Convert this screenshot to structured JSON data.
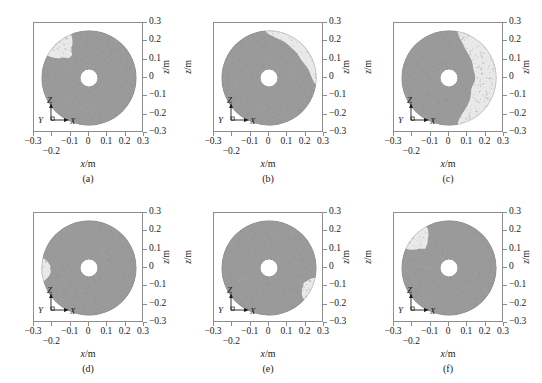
{
  "figure": {
    "axis_titles": {
      "x": "x",
      "x_unit": "/m",
      "z": "z",
      "z_unit": "/m"
    },
    "triad": {
      "z": "Z",
      "x": "X",
      "y": "Y"
    },
    "colors": {
      "particle_dark": "#9a9a9a",
      "particle_light": "#e9e9e9",
      "frame": "#8e8e8e",
      "background": "#ffffff",
      "text": "#1a1a1a"
    },
    "xticks": [
      "-0.3",
      "-0.2",
      "-0.1",
      "0",
      "0.1",
      "0.2",
      "0.3"
    ],
    "yticks": [
      "0.3",
      "0.2",
      "0.1",
      "0",
      "-0.1",
      "-0.2",
      "-0.3"
    ],
    "panels": [
      {
        "caption": "(a)",
        "show_left_axis_title": false
      },
      {
        "caption": "(b)",
        "show_left_axis_title": true
      },
      {
        "caption": "(c)",
        "show_left_axis_title": true
      },
      {
        "caption": "(d)",
        "show_left_axis_title": false
      },
      {
        "caption": "(e)",
        "show_left_axis_title": true
      },
      {
        "caption": "(f)",
        "show_left_axis_title": true
      }
    ]
  },
  "chart_data": {
    "type": "scatter",
    "title": "",
    "xlabel": "x/m",
    "ylabel": "z/m",
    "xlim": [
      -0.3,
      0.3
    ],
    "ylim": [
      -0.3,
      0.3
    ],
    "grid": false,
    "legend": null,
    "geometry": {
      "outer_radius_m": 0.26,
      "inner_radius_m": 0.045,
      "center": [
        0.0,
        0.0
      ]
    },
    "panels": [
      {
        "id": "a",
        "caption": "(a)",
        "light_region": {
          "present": true,
          "location": "upper-left",
          "angle_range_deg": [
            112,
            152
          ],
          "radial_extent_frac": [
            0.6,
            1.0
          ],
          "area_fraction": 0.04
        }
      },
      {
        "id": "b",
        "caption": "(b)",
        "light_region": {
          "present": true,
          "location": "upper-right arc",
          "angle_range_deg": [
            -8,
            95
          ],
          "radial_extent_frac": [
            0.78,
            1.0
          ],
          "area_fraction": 0.1
        }
      },
      {
        "id": "c",
        "caption": "(c)",
        "light_region": {
          "present": true,
          "location": "right crescent, top to bottom",
          "angle_range_deg": [
            -80,
            80
          ],
          "radial_extent_frac": [
            0.52,
            1.0
          ],
          "area_fraction": 0.26
        }
      },
      {
        "id": "d",
        "caption": "(d)",
        "light_region": {
          "present": true,
          "location": "left edge, small patch",
          "angle_range_deg": [
            168,
            196
          ],
          "radial_extent_frac": [
            0.8,
            1.0
          ],
          "area_fraction": 0.02
        }
      },
      {
        "id": "e",
        "caption": "(e)",
        "light_region": {
          "present": true,
          "location": "lower-right edge, small patch",
          "angle_range_deg": [
            -42,
            -12
          ],
          "radial_extent_frac": [
            0.8,
            1.0
          ],
          "area_fraction": 0.02
        }
      },
      {
        "id": "f",
        "caption": "(f)",
        "light_region": {
          "present": true,
          "location": "upper-left, small wedge",
          "angle_range_deg": [
            118,
            156
          ],
          "radial_extent_frac": [
            0.66,
            1.0
          ],
          "area_fraction": 0.035
        }
      }
    ]
  }
}
